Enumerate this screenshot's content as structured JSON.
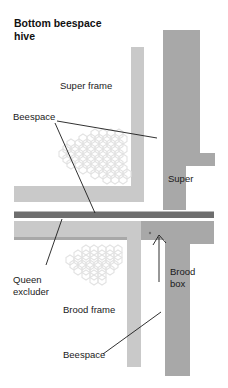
{
  "diagram": {
    "title_line1": "Bottom beespace",
    "title_line2": "hive",
    "caption_type": "beekeeping hive cross-section diagram",
    "labels": {
      "super_frame": "Super frame",
      "beespace_top": "Beespace",
      "super": "Super",
      "queen_excluder_line1": "Queen",
      "queen_excluder_line2": "excluder",
      "brood_box_line1": "Brood",
      "brood_box_line2": "box",
      "brood_frame": "Brood frame",
      "beespace_bottom": "Beespace"
    },
    "colors": {
      "background": "#ffffff",
      "box_body": "#a8a8a8",
      "frame_timber": "#c9c9c9",
      "queen_excluder": "#6e6e6e",
      "comb_outline": "#e2e2e2",
      "text": "#1a1a1a",
      "leader_line": "#1a1a1a"
    },
    "parts": [
      {
        "name": "super-box",
        "fill": "#a8a8a8"
      },
      {
        "name": "super-frame",
        "fill": "#c9c9c9"
      },
      {
        "name": "queen-excluder-bar",
        "fill": "#6e6e6e"
      },
      {
        "name": "brood-box",
        "fill": "#a8a8a8"
      },
      {
        "name": "brood-frame",
        "fill": "#c9c9c9"
      },
      {
        "name": "honeycomb-super",
        "fill": "#e2e2e2"
      },
      {
        "name": "honeycomb-brood",
        "fill": "#e2e2e2"
      }
    ]
  }
}
